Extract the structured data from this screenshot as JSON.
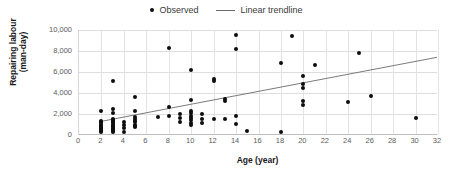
{
  "chart_data": {
    "type": "scatter",
    "title": "",
    "xlabel": "Age (year)",
    "ylabel": "Repairing labour (man-day)",
    "ylabel_line1": "Repairing labour",
    "ylabel_line2": "(man-day)",
    "xlim": [
      0,
      32
    ],
    "ylim": [
      0,
      10000
    ],
    "xticks": [
      0,
      2,
      4,
      6,
      8,
      10,
      12,
      14,
      16,
      18,
      20,
      22,
      24,
      26,
      28,
      30,
      32
    ],
    "xtick_labels": [
      "0",
      "2",
      "4",
      "6",
      "8",
      "10",
      "12",
      "14",
      "16",
      "18",
      "20",
      "22",
      "24",
      "26",
      "28",
      "30",
      "32"
    ],
    "yticks": [
      0,
      2000,
      4000,
      6000,
      8000,
      10000
    ],
    "ytick_labels": [
      "0",
      "2,000",
      "4,000",
      "6,000",
      "8,000",
      "10,000"
    ],
    "grid": true,
    "grid_axis": "both",
    "legend_position": "top-center",
    "legend": [
      {
        "label": "Observed",
        "marker": "circle",
        "color": "#0d0d0d"
      },
      {
        "label": "Linear trendline",
        "marker": "line",
        "color": "#6b6b6b"
      }
    ],
    "series": [
      {
        "name": "Observed",
        "marker": "circle",
        "color": "#0d0d0d",
        "points": [
          [
            2,
            2300
          ],
          [
            2,
            1350
          ],
          [
            2,
            1200
          ],
          [
            2,
            1100
          ],
          [
            2,
            1000
          ],
          [
            2,
            900
          ],
          [
            2,
            800
          ],
          [
            2,
            700
          ],
          [
            2,
            600
          ],
          [
            2,
            500
          ],
          [
            2,
            400
          ],
          [
            2,
            300
          ],
          [
            3,
            5100
          ],
          [
            3,
            2500
          ],
          [
            3,
            2100
          ],
          [
            3,
            1500
          ],
          [
            3,
            1400
          ],
          [
            3,
            1300
          ],
          [
            3,
            1200
          ],
          [
            3,
            1100
          ],
          [
            3,
            1000
          ],
          [
            3,
            900
          ],
          [
            3,
            800
          ],
          [
            3,
            700
          ],
          [
            3,
            600
          ],
          [
            3,
            500
          ],
          [
            3,
            400
          ],
          [
            3,
            300
          ],
          [
            4,
            1200
          ],
          [
            4,
            1000
          ],
          [
            4,
            700
          ],
          [
            4,
            300
          ],
          [
            5,
            3650
          ],
          [
            5,
            2250
          ],
          [
            5,
            1700
          ],
          [
            5,
            1500
          ],
          [
            5,
            1300
          ],
          [
            5,
            1200
          ],
          [
            5,
            1000
          ],
          [
            5,
            900
          ],
          [
            5,
            800
          ],
          [
            7,
            1700
          ],
          [
            8,
            8300
          ],
          [
            8,
            2650
          ],
          [
            8,
            1800
          ],
          [
            9,
            2000
          ],
          [
            9,
            1600
          ],
          [
            9,
            1250
          ],
          [
            10,
            6200
          ],
          [
            10,
            3350
          ],
          [
            10,
            2250
          ],
          [
            10,
            2050
          ],
          [
            10,
            1800
          ],
          [
            10,
            1600
          ],
          [
            10,
            1400
          ],
          [
            10,
            1100
          ],
          [
            10,
            1000
          ],
          [
            11,
            2000
          ],
          [
            11,
            1500
          ],
          [
            11,
            1100
          ],
          [
            12,
            5300
          ],
          [
            12,
            5150
          ],
          [
            12,
            1550
          ],
          [
            13,
            3450
          ],
          [
            13,
            3200
          ],
          [
            13,
            1550
          ],
          [
            14,
            9550
          ],
          [
            14,
            8150
          ],
          [
            14,
            1800
          ],
          [
            14,
            1050
          ],
          [
            15,
            400
          ],
          [
            18,
            6900
          ],
          [
            18,
            300
          ],
          [
            19,
            9450
          ],
          [
            20,
            5600
          ],
          [
            20,
            4900
          ],
          [
            20,
            4500
          ],
          [
            20,
            3200
          ],
          [
            20,
            2900
          ],
          [
            21,
            6700
          ],
          [
            24,
            3100
          ],
          [
            25,
            7800
          ],
          [
            26,
            3700
          ],
          [
            30,
            1600
          ]
        ]
      }
    ],
    "trendline": {
      "name": "Linear trendline",
      "color": "#6b6b6b",
      "x_start": 2,
      "y_start": 1300,
      "x_end": 32,
      "y_end": 7400
    }
  }
}
